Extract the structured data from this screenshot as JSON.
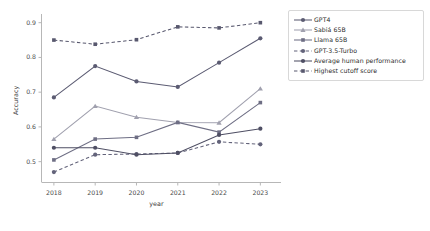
{
  "chart_data": {
    "type": "line",
    "title": "",
    "xlabel": "year",
    "ylabel": "Accuracy",
    "categories": [
      "2018",
      "2019",
      "2020",
      "2021",
      "2022",
      "2023"
    ],
    "x": [
      2018,
      2019,
      2020,
      2021,
      2022,
      2023
    ],
    "xlim": [
      2017.7,
      2023.5
    ],
    "ylim": [
      0.44,
      0.925
    ],
    "yticks": [
      0.5,
      0.6,
      0.7,
      0.8,
      0.9
    ],
    "ytick_labels": [
      "0.5",
      "0.6",
      "0.7",
      "0.8",
      "0.9"
    ],
    "xticks": [
      2018,
      2019,
      2020,
      2021,
      2022,
      2023
    ],
    "xtick_labels": [
      "2018",
      "2019",
      "2020",
      "2021",
      "2022",
      "2023"
    ],
    "grid": false,
    "legend_position": "right outside, upper",
    "series": [
      {
        "name": "GPT4",
        "values": [
          0.685,
          0.775,
          0.731,
          0.715,
          0.785,
          0.855
        ],
        "color": "#5b5b72",
        "linestyle": "solid",
        "marker": "circle"
      },
      {
        "name": "Sabiá 65B",
        "values": [
          0.565,
          0.66,
          0.628,
          0.613,
          0.612,
          0.71
        ],
        "color": "#a0a0ae",
        "linestyle": "solid",
        "marker": "triangle-up"
      },
      {
        "name": "Llama 65B",
        "values": [
          0.505,
          0.565,
          0.57,
          0.613,
          0.585,
          0.67
        ],
        "color": "#6e6e84",
        "linestyle": "solid",
        "marker": "square"
      },
      {
        "name": "GPT-3.5-Turbo",
        "values": [
          0.47,
          0.52,
          0.522,
          0.525,
          0.557,
          0.55
        ],
        "color": "#63637a",
        "linestyle": "dashed",
        "marker": "circle"
      },
      {
        "name": "Average human performance",
        "values": [
          0.54,
          0.54,
          0.52,
          0.525,
          0.577,
          0.595
        ],
        "color": "#4f4f64",
        "linestyle": "solid",
        "marker": "circle"
      },
      {
        "name": "Highest cutoff score",
        "values": [
          0.85,
          0.838,
          0.851,
          0.888,
          0.885,
          0.9
        ],
        "color": "#58586e",
        "linestyle": "dashed",
        "marker": "square"
      }
    ]
  },
  "legend": {
    "entries": [
      "GPT4",
      "Sabiá 65B",
      "Llama 65B",
      "GPT-3.5-Turbo",
      "Average human performance",
      "Highest cutoff score"
    ]
  }
}
